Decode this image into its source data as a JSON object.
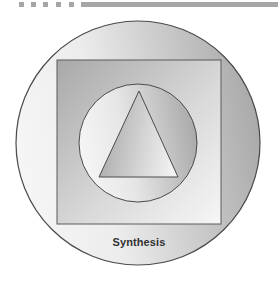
{
  "header": {
    "dots": [
      {
        "x": 19
      },
      {
        "x": 31
      },
      {
        "x": 43
      },
      {
        "x": 56
      },
      {
        "x": 69
      }
    ],
    "bar_color": "#a6a6a6"
  },
  "diagram": {
    "caption": "Synthesis",
    "shapes": {
      "outer_circle": {
        "cx": 138,
        "cy": 143,
        "r": 122,
        "gradient": [
          "#f6f6f6",
          "#a9a9a9"
        ]
      },
      "square": {
        "x": 57,
        "y": 60,
        "width": 164,
        "height": 164,
        "gradient": [
          "#a8a8a8",
          "#f4f4f4"
        ]
      },
      "inner_circle": {
        "cx": 138,
        "cy": 143,
        "r": 59,
        "gradient": [
          "#f4f4f4",
          "#a9a9a9"
        ]
      },
      "triangle": {
        "points": "139,91 99,177 178,177",
        "gradient": [
          "#a8a8a8",
          "#f4f4f4"
        ]
      }
    },
    "stroke_color": "#4a4a4a"
  }
}
